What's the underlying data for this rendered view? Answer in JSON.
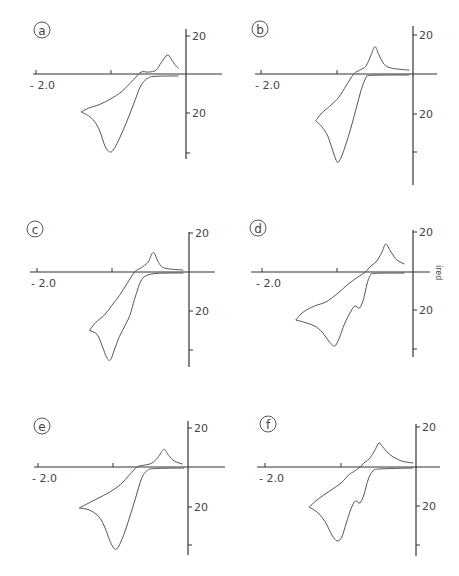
{
  "figure": {
    "y_axis_label": "i_red",
    "x_tick_label": "-2.0",
    "y_tick_labels": [
      "20",
      "20"
    ]
  },
  "chart_data": [
    {
      "type": "line",
      "panel": "a",
      "xlabel": "E (V)",
      "ylabel": "i_red",
      "x_tick_labels": [
        "-2.0"
      ],
      "y_tick_labels": [
        "20",
        "20"
      ],
      "xlim": [
        -2.05,
        0.5
      ],
      "ylim": [
        -45,
        22
      ],
      "origin_px": [
        186,
        74
      ],
      "series": [
        {
          "name": "cathodic sweep",
          "points": [
            [
              -0.1,
              -1
            ],
            [
              -0.4,
              -1.2
            ],
            [
              -0.5,
              -2
            ],
            [
              -0.6,
              -6
            ],
            [
              -0.7,
              -16
            ],
            [
              -0.8,
              -26
            ],
            [
              -0.9,
              -35
            ],
            [
              -0.97,
              -40
            ],
            [
              -1.02,
              -41
            ],
            [
              -1.08,
              -38
            ],
            [
              -1.15,
              -30
            ],
            [
              -1.22,
              -25
            ],
            [
              -1.3,
              -22
            ],
            [
              -1.4,
              -20
            ]
          ]
        },
        {
          "name": "anodic sweep",
          "points": [
            [
              -1.4,
              -20
            ],
            [
              -1.3,
              -18
            ],
            [
              -1.15,
              -16
            ],
            [
              -1.0,
              -13
            ],
            [
              -0.85,
              -9
            ],
            [
              -0.7,
              -3
            ],
            [
              -0.6,
              1
            ],
            [
              -0.5,
              1
            ],
            [
              -0.4,
              2
            ],
            [
              -0.33,
              6
            ],
            [
              -0.25,
              10
            ],
            [
              -0.2,
              8
            ],
            [
              -0.15,
              5
            ],
            [
              -0.1,
              3
            ]
          ]
        }
      ]
    },
    {
      "type": "line",
      "panel": "b",
      "xlabel": "E (V)",
      "ylabel": "i_red",
      "x_tick_labels": [
        "-2.0"
      ],
      "y_tick_labels": [
        "20",
        "20"
      ],
      "xlim": [
        -2.05,
        0.3
      ],
      "ylim": [
        -48,
        22
      ],
      "origin_px": [
        413,
        74
      ],
      "series": [
        {
          "name": "cathodic sweep",
          "points": [
            [
              -0.05,
              -0.5
            ],
            [
              -0.55,
              -0.7
            ],
            [
              -0.62,
              -2
            ],
            [
              -0.68,
              -8
            ],
            [
              -0.75,
              -18
            ],
            [
              -0.82,
              -28
            ],
            [
              -0.9,
              -38
            ],
            [
              -0.96,
              -44
            ],
            [
              -1.0,
              -45
            ],
            [
              -1.05,
              -40
            ],
            [
              -1.12,
              -32
            ],
            [
              -1.2,
              -27
            ],
            [
              -1.28,
              -24
            ]
          ]
        },
        {
          "name": "anodic sweep",
          "points": [
            [
              -1.28,
              -24
            ],
            [
              -1.2,
              -20
            ],
            [
              -1.08,
              -16
            ],
            [
              -0.98,
              -12
            ],
            [
              -0.88,
              -6
            ],
            [
              -0.78,
              0
            ],
            [
              -0.7,
              2
            ],
            [
              -0.62,
              4
            ],
            [
              -0.55,
              10
            ],
            [
              -0.5,
              14
            ],
            [
              -0.45,
              10
            ],
            [
              -0.38,
              5
            ],
            [
              -0.28,
              3
            ],
            [
              -0.05,
              2
            ]
          ]
        }
      ]
    },
    {
      "type": "line",
      "panel": "c",
      "xlabel": "E (V)",
      "ylabel": "i_red",
      "x_tick_labels": [
        "-2.0"
      ],
      "y_tick_labels": [
        "20",
        "20"
      ],
      "xlim": [
        -2.05,
        0.35
      ],
      "ylim": [
        -48,
        22
      ],
      "origin_px": [
        189,
        272
      ],
      "series": [
        {
          "name": "cathodic sweep",
          "points": [
            [
              -0.05,
              -0.5
            ],
            [
              -0.4,
              -0.7
            ],
            [
              -0.55,
              -2
            ],
            [
              -0.62,
              -5
            ],
            [
              -0.7,
              -14
            ],
            [
              -0.76,
              -22
            ],
            [
              -0.82,
              -27
            ],
            [
              -0.9,
              -33
            ],
            [
              -0.97,
              -40
            ],
            [
              -1.02,
              -45
            ],
            [
              -1.07,
              -44
            ],
            [
              -1.13,
              -38
            ],
            [
              -1.2,
              -32
            ],
            [
              -1.3,
              -30
            ]
          ]
        },
        {
          "name": "anodic sweep",
          "points": [
            [
              -1.3,
              -30
            ],
            [
              -1.22,
              -26
            ],
            [
              -1.1,
              -22
            ],
            [
              -1.0,
              -17
            ],
            [
              -0.9,
              -12
            ],
            [
              -0.8,
              -6
            ],
            [
              -0.7,
              0
            ],
            [
              -0.62,
              2
            ],
            [
              -0.52,
              5
            ],
            [
              -0.45,
              10
            ],
            [
              -0.38,
              5
            ],
            [
              -0.3,
              2
            ],
            [
              -0.05,
              1
            ]
          ]
        }
      ]
    },
    {
      "type": "line",
      "panel": "d",
      "xlabel": "E (V)",
      "ylabel": "i_red",
      "x_tick_labels": [
        "-2.0"
      ],
      "y_tick_labels": [
        "20",
        "20"
      ],
      "xlim": [
        -2.15,
        0.3
      ],
      "ylim": [
        -45,
        22
      ],
      "origin_px": [
        413,
        272
      ],
      "series": [
        {
          "name": "cathodic sweep",
          "points": [
            [
              -0.1,
              -0.5
            ],
            [
              -0.5,
              -0.7
            ],
            [
              -0.56,
              -2
            ],
            [
              -0.6,
              -6
            ],
            [
              -0.65,
              -14
            ],
            [
              -0.7,
              -18
            ],
            [
              -0.76,
              -17
            ],
            [
              -0.82,
              -20
            ],
            [
              -0.9,
              -26
            ],
            [
              -0.97,
              -33
            ],
            [
              -1.03,
              -37
            ],
            [
              -1.1,
              -35
            ],
            [
              -1.2,
              -30
            ],
            [
              -1.3,
              -27
            ],
            [
              -1.45,
              -25
            ],
            [
              -1.55,
              -24
            ]
          ]
        },
        {
          "name": "anodic sweep",
          "points": [
            [
              -1.55,
              -24
            ],
            [
              -1.45,
              -20
            ],
            [
              -1.3,
              -17
            ],
            [
              -1.15,
              -15
            ],
            [
              -1.0,
              -11
            ],
            [
              -0.88,
              -7
            ],
            [
              -0.78,
              -4
            ],
            [
              -0.7,
              -2
            ],
            [
              -0.62,
              0
            ],
            [
              -0.55,
              3
            ],
            [
              -0.48,
              5
            ],
            [
              -0.4,
              10
            ],
            [
              -0.35,
              14
            ],
            [
              -0.28,
              10
            ],
            [
              -0.2,
              6
            ],
            [
              -0.1,
              4
            ]
          ]
        }
      ]
    },
    {
      "type": "line",
      "panel": "e",
      "xlabel": "E (V)",
      "ylabel": "i_red",
      "x_tick_labels": [
        "-2.0"
      ],
      "y_tick_labels": [
        "20",
        "20"
      ],
      "xlim": [
        -2.05,
        0.45
      ],
      "ylim": [
        -45,
        22
      ],
      "origin_px": [
        188,
        467
      ],
      "series": [
        {
          "name": "cathodic sweep",
          "points": [
            [
              -0.05,
              -0.5
            ],
            [
              -0.45,
              -0.8
            ],
            [
              -0.55,
              -2
            ],
            [
              -0.62,
              -6
            ],
            [
              -0.7,
              -16
            ],
            [
              -0.78,
              -26
            ],
            [
              -0.86,
              -35
            ],
            [
              -0.93,
              -41
            ],
            [
              -0.98,
              -42
            ],
            [
              -1.04,
              -38
            ],
            [
              -1.12,
              -30
            ],
            [
              -1.2,
              -25
            ],
            [
              -1.32,
              -22
            ],
            [
              -1.45,
              -21
            ]
          ]
        },
        {
          "name": "anodic sweep",
          "points": [
            [
              -1.45,
              -21
            ],
            [
              -1.35,
              -19
            ],
            [
              -1.2,
              -16
            ],
            [
              -1.05,
              -13
            ],
            [
              -0.9,
              -9
            ],
            [
              -0.78,
              -4
            ],
            [
              -0.68,
              0
            ],
            [
              -0.58,
              1
            ],
            [
              -0.48,
              2
            ],
            [
              -0.4,
              5
            ],
            [
              -0.32,
              9
            ],
            [
              -0.26,
              6
            ],
            [
              -0.18,
              3
            ],
            [
              -0.07,
              1.5
            ]
          ]
        }
      ]
    },
    {
      "type": "line",
      "panel": "f",
      "xlabel": "E (V)",
      "ylabel": "i_red",
      "x_tick_labels": [
        "-2.0"
      ],
      "y_tick_labels": [
        "20",
        "20"
      ],
      "xlim": [
        -2.05,
        0.35
      ],
      "ylim": [
        -45,
        22
      ],
      "origin_px": [
        416,
        466
      ],
      "series": [
        {
          "name": "cathodic sweep",
          "points": [
            [
              -0.05,
              -0.5
            ],
            [
              -0.5,
              -1
            ],
            [
              -0.58,
              -2
            ],
            [
              -0.64,
              -6
            ],
            [
              -0.7,
              -14
            ],
            [
              -0.75,
              -18
            ],
            [
              -0.81,
              -17
            ],
            [
              -0.87,
              -21
            ],
            [
              -0.93,
              -28
            ],
            [
              -0.99,
              -35
            ],
            [
              -1.05,
              -37
            ],
            [
              -1.12,
              -34
            ],
            [
              -1.2,
              -28
            ],
            [
              -1.3,
              -23
            ],
            [
              -1.42,
              -20
            ]
          ]
        },
        {
          "name": "anodic sweep",
          "points": [
            [
              -1.42,
              -20
            ],
            [
              -1.3,
              -16
            ],
            [
              -1.15,
              -12
            ],
            [
              -1.0,
              -8
            ],
            [
              -0.9,
              -4
            ],
            [
              -0.82,
              -2
            ],
            [
              -0.75,
              0
            ],
            [
              -0.7,
              2
            ],
            [
              -0.63,
              4
            ],
            [
              -0.56,
              8
            ],
            [
              -0.5,
              12
            ],
            [
              -0.45,
              10
            ],
            [
              -0.35,
              6
            ],
            [
              -0.2,
              3
            ],
            [
              -0.05,
              2
            ]
          ]
        }
      ]
    }
  ],
  "panels": [
    {
      "letter": "a",
      "circle_px": [
        42,
        30
      ],
      "axes": {
        "x0": 33,
        "x1": 222,
        "y": 74,
        "vx": 186,
        "vy0": 29,
        "vy1": 159,
        "tick_m2": 36,
        "tick_m1": 111,
        "ytick_top": 36,
        "ytick_mid": 113,
        "ytick_bot": 153
      }
    },
    {
      "letter": "b",
      "circle_px": [
        260,
        29
      ],
      "axes": {
        "x0": 255,
        "x1": 437,
        "y": 74,
        "vx": 413,
        "vy0": 26,
        "vy1": 185,
        "tick_m2": 261,
        "tick_m1": 337,
        "ytick_top": 35,
        "ytick_mid": 114,
        "ytick_bot": 152
      }
    },
    {
      "letter": "c",
      "circle_px": [
        35,
        229
      ],
      "axes": {
        "x0": 30,
        "x1": 215,
        "y": 272,
        "vx": 189,
        "vy0": 232,
        "vy1": 367,
        "tick_m2": 37,
        "tick_m1": 112,
        "ytick_top": 233,
        "ytick_mid": 311,
        "ytick_bot": 350
      }
    },
    {
      "letter": "d",
      "circle_px": [
        258,
        228
      ],
      "axes": {
        "x0": 251,
        "x1": 430,
        "y": 272,
        "vx": 413,
        "vy0": 230,
        "vy1": 357,
        "tick_m2": 262,
        "tick_m1": 337,
        "ytick_top": 232,
        "ytick_mid": 310,
        "ytick_bot": 349
      }
    },
    {
      "letter": "e",
      "circle_px": [
        42,
        426
      ],
      "axes": {
        "x0": 34,
        "x1": 225,
        "y": 467,
        "vx": 188,
        "vy0": 421,
        "vy1": 555,
        "tick_m2": 38,
        "tick_m1": 113,
        "ytick_top": 428,
        "ytick_mid": 507,
        "ytick_bot": 545
      }
    },
    {
      "letter": "f",
      "circle_px": [
        268,
        424
      ],
      "axes": {
        "x0": 257,
        "x1": 440,
        "y": 467,
        "vx": 416,
        "vy0": 424,
        "vy1": 556,
        "tick_m2": 265,
        "tick_m1": 341,
        "ytick_top": 427,
        "ytick_mid": 506,
        "ytick_bot": 545
      }
    }
  ]
}
